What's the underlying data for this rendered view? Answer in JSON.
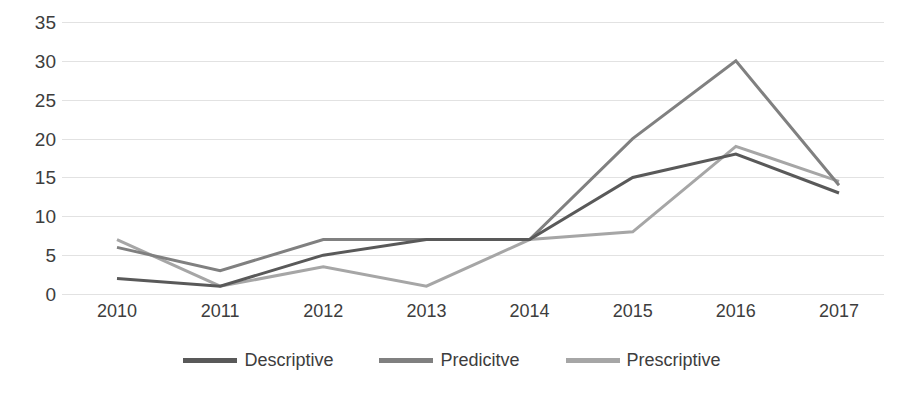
{
  "chart_data": {
    "type": "line",
    "title": "",
    "subtitle": "",
    "xlabel": "",
    "ylabel": "",
    "categories": [
      "2010",
      "2011",
      "2012",
      "2013",
      "2014",
      "2015",
      "2016",
      "2017"
    ],
    "series": [
      {
        "name": "Descriptive",
        "color": "#595959",
        "values": [
          2,
          1,
          5,
          7,
          7,
          15,
          18,
          13
        ]
      },
      {
        "name": "Predicitve",
        "color": "#808080",
        "values": [
          6,
          3,
          7,
          7,
          7,
          20,
          30,
          14
        ]
      },
      {
        "name": "Prescriptive",
        "color": "#a6a6a6",
        "values": [
          7,
          1,
          3.5,
          1,
          7,
          8,
          19,
          14.5
        ]
      }
    ],
    "ylim": [
      0,
      35
    ],
    "ytick_values": [
      0,
      5,
      10,
      15,
      20,
      25,
      30,
      35
    ],
    "ytick_labels": [
      "0",
      "5",
      "10",
      "15",
      "20",
      "25",
      "30",
      "35"
    ],
    "grid": true,
    "grid_color": "#e2e2e2",
    "grid_axis": "y",
    "legend_position": "bottom",
    "background_color": "#ffffff",
    "line_width": 3
  }
}
